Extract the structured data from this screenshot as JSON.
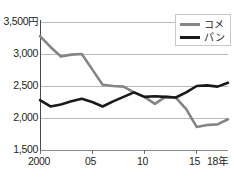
{
  "chart_data": {
    "type": "line",
    "title": "",
    "xlabel": "",
    "ylabel": "",
    "unit_label": "円",
    "ylim": [
      1500,
      3500
    ],
    "ytick_values": [
      3500,
      3000,
      2500,
      2000,
      1500
    ],
    "ytick_labels": [
      "3,500",
      "3,000",
      "2,500",
      "2,000",
      "1,500"
    ],
    "ytick_top_label": "3,500円",
    "xlim": [
      2000,
      2018
    ],
    "xtick_values": [
      2000,
      2005,
      2010,
      2015,
      2018
    ],
    "xtick_labels": [
      "2000",
      "05",
      "10",
      "15",
      "18年"
    ],
    "grid": true,
    "grid_axis": "y",
    "legend_position": "top-right",
    "x": [
      2000,
      2001,
      2002,
      2003,
      2004,
      2005,
      2006,
      2007,
      2008,
      2009,
      2010,
      2011,
      2012,
      2013,
      2014,
      2015,
      2016,
      2017,
      2018
    ],
    "series": [
      {
        "name": "コメ",
        "color": "#858585",
        "values": [
          3280,
          3110,
          2960,
          2990,
          3000,
          2760,
          2520,
          2500,
          2490,
          2400,
          2330,
          2220,
          2330,
          2320,
          2140,
          1860,
          1890,
          1900,
          1980
        ]
      },
      {
        "name": "パン",
        "color": "#1a1a1a",
        "values": [
          2280,
          2180,
          2210,
          2260,
          2300,
          2250,
          2180,
          2260,
          2330,
          2400,
          2330,
          2340,
          2330,
          2320,
          2400,
          2500,
          2510,
          2490,
          2550
        ]
      }
    ]
  },
  "legend": {
    "items": [
      {
        "label": "コメ",
        "color": "#858585"
      },
      {
        "label": "パン",
        "color": "#1a1a1a"
      }
    ]
  },
  "axes": {
    "y_labels": [
      "3,500円",
      "3,000",
      "2,500",
      "2,000",
      "1,500"
    ],
    "x_labels": [
      "2000",
      "05",
      "10",
      "15",
      "18年"
    ]
  }
}
